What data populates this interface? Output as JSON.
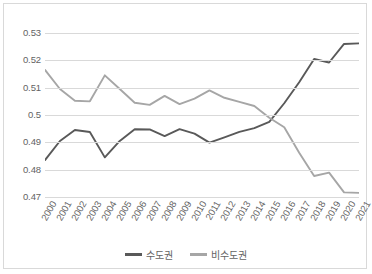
{
  "chart_data": {
    "type": "line",
    "title": "",
    "subtitle": "",
    "xlabel": "",
    "ylabel": "",
    "categories": [
      "2000",
      "2001",
      "2002",
      "2003",
      "2004",
      "2005",
      "2006",
      "2007",
      "2008",
      "2009",
      "2010",
      "2011",
      "2012",
      "2013",
      "2014",
      "2015",
      "2016",
      "2017",
      "2018",
      "2019",
      "2020",
      "2021"
    ],
    "ylim": [
      0.47,
      0.53
    ],
    "ytick_step": 0.01,
    "yticks": [
      "0.47",
      "0.48",
      "0.49",
      "0.5",
      "0.51",
      "0.52",
      "0.53"
    ],
    "ytick_values": [
      0.47,
      0.48,
      0.49,
      0.5,
      0.51,
      0.52,
      0.53
    ],
    "grid": "horizontal",
    "legend_position": "bottom-center",
    "series": [
      {
        "name": "수도권",
        "color": "#595959",
        "values": [
          0.4835,
          0.4905,
          0.4945,
          0.4938,
          0.4845,
          0.4905,
          0.4948,
          0.4947,
          0.4923,
          0.4948,
          0.4932,
          0.4899,
          0.4918,
          0.4938,
          0.4952,
          0.4975,
          0.5043,
          0.512,
          0.5205,
          0.5192,
          0.526,
          0.5262
        ]
      },
      {
        "name": "비수도권",
        "color": "#a6a6a6",
        "values": [
          0.5165,
          0.5095,
          0.5052,
          0.505,
          0.5145,
          0.5095,
          0.5045,
          0.5037,
          0.507,
          0.504,
          0.506,
          0.509,
          0.5063,
          0.5048,
          0.5033,
          0.499,
          0.4955,
          0.4862,
          0.4777,
          0.4789,
          0.4717,
          0.4715
        ]
      }
    ]
  },
  "legend": {
    "items": [
      {
        "label": "수도권",
        "color": "#595959"
      },
      {
        "label": "비수도권",
        "color": "#a6a6a6"
      }
    ]
  },
  "colors": {
    "gridline": "#d9d9d9",
    "border": "#d9d9d9",
    "axis_text": "#636363",
    "background": "#ffffff"
  }
}
